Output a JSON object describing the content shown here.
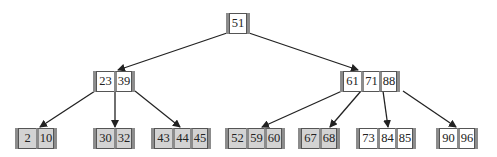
{
  "diagram": {
    "type": "b-tree",
    "colors": {
      "leaf_gray": "#d3d3d3",
      "node_white": "#ffffff",
      "separator": "#8c8c8c",
      "edge": "#222222"
    },
    "root": {
      "keys": [
        "51"
      ]
    },
    "internal": [
      {
        "keys": [
          "23",
          "39"
        ]
      },
      {
        "keys": [
          "61",
          "71",
          "88"
        ]
      }
    ],
    "leaves": [
      {
        "keys": [
          "2",
          "10"
        ],
        "shade": "gray"
      },
      {
        "keys": [
          "30",
          "32"
        ],
        "shade": "gray"
      },
      {
        "keys": [
          "43",
          "44",
          "45"
        ],
        "shade": "gray"
      },
      {
        "keys": [
          "52",
          "59",
          "60"
        ],
        "shade": "gray"
      },
      {
        "keys": [
          "67",
          "68"
        ],
        "shade": "gray"
      },
      {
        "keys": [
          "73",
          "84",
          "85"
        ],
        "shade": "white"
      },
      {
        "keys": [
          "90",
          "96"
        ],
        "shade": "white"
      }
    ]
  }
}
